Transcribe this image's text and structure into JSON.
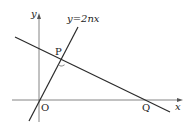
{
  "diagram": {
    "type": "coordinate-geometry",
    "axes": {
      "x_label": "x",
      "y_label": "y",
      "origin_label": "O"
    },
    "lines": [
      {
        "name": "line-through-origin",
        "equation_label": "y=2nx"
      },
      {
        "name": "perpendicular-line",
        "equation_label": ""
      }
    ],
    "points": [
      {
        "label": "P",
        "description": "foot of perpendicular, intersection of the two lines (right angle mark)"
      },
      {
        "label": "Q",
        "description": "x-intercept of perpendicular line"
      },
      {
        "label": "O",
        "description": "origin"
      }
    ],
    "colors": {
      "line": "#2a2a2a",
      "axis": "#555555",
      "background": "#ffffff"
    }
  }
}
